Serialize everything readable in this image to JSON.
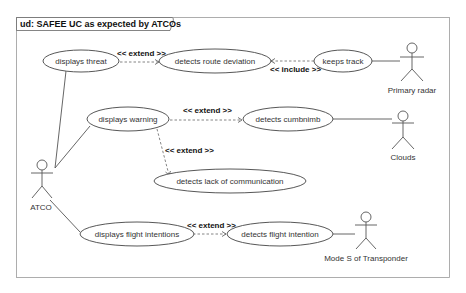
{
  "diagram": {
    "title": "ud: SAFEE UC as expected by ATCOs",
    "type": "use-case",
    "actors": [
      {
        "id": "atco",
        "label": "ATCO"
      },
      {
        "id": "primary_radar",
        "label": "Primary radar"
      },
      {
        "id": "clouds",
        "label": "Clouds"
      },
      {
        "id": "mode_s",
        "label": "Mode S of Transponder"
      }
    ],
    "use_cases": [
      {
        "id": "displays_threat",
        "label": "displays threat"
      },
      {
        "id": "detects_route_deviation",
        "label": "detects route deviation"
      },
      {
        "id": "keeps_track",
        "label": "keeps track"
      },
      {
        "id": "displays_warning",
        "label": "displays warning"
      },
      {
        "id": "detects_cumbnimb",
        "label": "detects cumbnimb"
      },
      {
        "id": "detects_lack_of_communication",
        "label": "detects lack of communication"
      },
      {
        "id": "displays_flight_intentions",
        "label": "displays flight intentions"
      },
      {
        "id": "detects_flight_intention",
        "label": "detects flight intention"
      }
    ],
    "relationships": [
      {
        "type": "extend",
        "label": "<< extend >>",
        "from": "detects_route_deviation",
        "to": "displays_threat"
      },
      {
        "type": "include",
        "label": "<< include >>",
        "from": "keeps_track",
        "to": "detects_route_deviation"
      },
      {
        "type": "extend",
        "label": "<< extend >>",
        "from": "detects_cumbnimb",
        "to": "displays_warning"
      },
      {
        "type": "extend",
        "label": "<< extend >>",
        "from": "detects_lack_of_communication",
        "to": "displays_warning"
      },
      {
        "type": "extend",
        "label": "<< extend >>",
        "from": "detects_flight_intention",
        "to": "displays_flight_intentions"
      },
      {
        "type": "association",
        "from": "atco",
        "to": "displays_threat"
      },
      {
        "type": "association",
        "from": "atco",
        "to": "displays_warning"
      },
      {
        "type": "association",
        "from": "atco",
        "to": "displays_flight_intentions"
      },
      {
        "type": "association",
        "from": "primary_radar",
        "to": "keeps_track"
      },
      {
        "type": "association",
        "from": "clouds",
        "to": "detects_cumbnimb"
      },
      {
        "type": "association",
        "from": "mode_s",
        "to": "detects_flight_intention"
      }
    ]
  }
}
